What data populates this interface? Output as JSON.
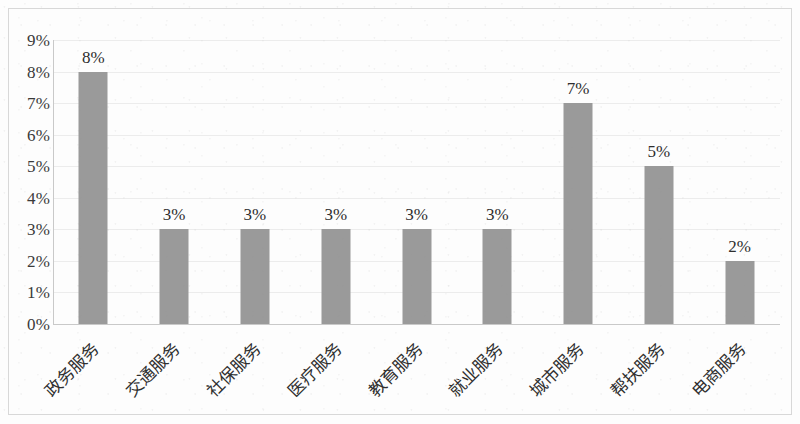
{
  "chart_data": {
    "type": "bar",
    "title": "",
    "subtitle": "",
    "xlabel": "",
    "ylabel": "",
    "categories": [
      "政务服务",
      "交通服务",
      "社保服务",
      "医疗服务",
      "教育服务",
      "就业服务",
      "城市服务",
      "帮扶服务",
      "电商服务"
    ],
    "values": [
      8,
      3,
      3,
      3,
      3,
      3,
      7,
      5,
      2
    ],
    "data_labels": [
      "8%",
      "3%",
      "3%",
      "3%",
      "3%",
      "3%",
      "7%",
      "5%",
      "2%"
    ],
    "ylim": [
      0,
      9
    ],
    "y_tick_values": [
      9,
      8,
      7,
      6,
      5,
      4,
      3,
      2,
      1,
      0
    ],
    "y_tick_labels": [
      "9%",
      "8%",
      "7%",
      "6%",
      "5%",
      "4%",
      "3%",
      "2%",
      "1%",
      "0%"
    ],
    "grid": true,
    "grid_axis": "y",
    "legend": false,
    "legend_position": "none",
    "bar_color": "#9a9a9a",
    "grid_color": "#ececec",
    "axis_color": "#c9c9c9",
    "label_color": "#2f2f2f",
    "background_color": "#fdfdfd",
    "x_label_rotation": -45,
    "units": "percent"
  }
}
